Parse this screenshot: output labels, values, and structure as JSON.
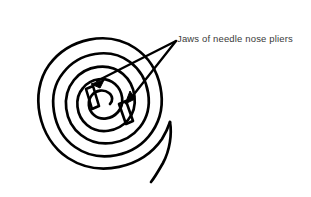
{
  "figure": {
    "background_color": "#ffffff",
    "ink_color": "#000000",
    "label_color": "#3a3a3a"
  },
  "annotation": {
    "text": "Jaws of needle nose pliers",
    "x": 177,
    "y": 33,
    "leader_origin": {
      "x": 176,
      "y": 41
    },
    "arrows": [
      {
        "name": "arrow-to-upper-jaw",
        "tip_x": 93,
        "tip_y": 80
      },
      {
        "name": "arrow-to-lower-jaw",
        "tip_x": 127,
        "tip_y": 101
      }
    ]
  },
  "spiral": {
    "name": "wire-spiral",
    "center_x": 98,
    "center_y": 97,
    "turns": 3,
    "stroke_width": 2.6,
    "outer_end": {
      "x": 163,
      "y": 182
    },
    "bounds": {
      "left": 19,
      "top": 14,
      "right": 180,
      "bottom": 179
    }
  },
  "jaws": [
    {
      "name": "jaw-upper",
      "x": 88,
      "y": 92,
      "angle_deg": 18,
      "width": 8,
      "height": 22
    },
    {
      "name": "jaw-lower",
      "x": 122,
      "y": 110,
      "angle_deg": 20,
      "width": 8,
      "height": 22
    }
  ]
}
